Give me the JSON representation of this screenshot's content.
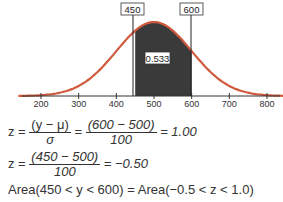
{
  "chart_data": {
    "type": "area",
    "title": "",
    "distribution": "normal",
    "mean": 500,
    "sd": 100,
    "xlabel": "y",
    "ylabel": "",
    "x_ticks": [
      200,
      300,
      400,
      500,
      600,
      700,
      800
    ],
    "xlim": [
      150,
      850
    ],
    "shaded_region": {
      "from": 450,
      "to": 600,
      "area": 0.533
    },
    "labels": [
      "450",
      "600",
      "0.533"
    ]
  },
  "labels": {
    "left": "450",
    "right": "600",
    "area": "0.533"
  },
  "ticks": [
    "200",
    "300",
    "400",
    "500",
    "600",
    "700",
    "800"
  ],
  "equations": {
    "eq1": {
      "lhs": "z =",
      "f1_num": "(y − μ)",
      "f1_den": "σ",
      "eq": "=",
      "f2_num": "(600 − 500)",
      "f2_den": "100",
      "result": "= 1.00"
    },
    "eq2": {
      "lhs": "z =",
      "f_num": "(450 − 500)",
      "f_den": "100",
      "result": "= −0.50"
    },
    "eq3": "Area(450 < y < 600) = Area(−0.5 < z < 1.0)"
  }
}
